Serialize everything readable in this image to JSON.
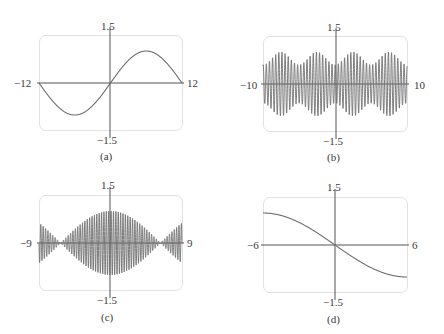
{
  "chart_data": [
    {
      "type": "line",
      "panel": "(a)",
      "title": "",
      "caption": "(a)",
      "xlim": [
        -12,
        12
      ],
      "ylim": [
        -1.5,
        1.5
      ],
      "tick_labels": {
        "xmin": "−12",
        "xmax": "12",
        "ymax": "1.5",
        "ymin": "−1.5"
      },
      "grid": false,
      "description": "Single period of a slow sine wave; min ~-1 near x=-6, max ~+1 near x=6, passes through origin, reaches 0 at x=±12",
      "x": [
        -12,
        -9,
        -6,
        -3,
        0,
        3,
        6,
        9,
        12
      ],
      "y": [
        0,
        -0.71,
        -1.0,
        -0.71,
        0,
        0.71,
        1.0,
        0.71,
        0
      ]
    },
    {
      "type": "line",
      "panel": "(b)",
      "title": "",
      "caption": "(b)",
      "xlim": [
        -10,
        10
      ],
      "ylim": [
        -1.5,
        1.5
      ],
      "tick_labels": {
        "xmin": "−10",
        "xmax": "10",
        "ymax": "1.5",
        "ymin": "−1.5"
      },
      "grid": false,
      "description": "Rapid oscillation (~46 cycles across window) with amplitude modulated between ~0.55 and ~1.0; envelope dips near x≈-5 and x≈5, peaks near x≈-7.5, 0±, 7.5",
      "envelope_x": [
        -10,
        -7.5,
        -5,
        -2.5,
        0,
        2.5,
        5,
        7.5,
        10
      ],
      "envelope_upper": [
        0.6,
        1.0,
        0.6,
        1.0,
        0.6,
        1.0,
        0.6,
        1.0,
        0.6
      ],
      "oscillation_cycles": 46
    },
    {
      "type": "line",
      "panel": "(c)",
      "title": "",
      "caption": "(c)",
      "xlim": [
        -9,
        9
      ],
      "ylim": [
        -1.5,
        1.5
      ],
      "tick_labels": {
        "xmin": "−9",
        "xmax": "9",
        "ymax": "1.5",
        "ymin": "−1.5"
      },
      "grid": false,
      "description": "Beat pattern: fast oscillation (~60 cycles) inside envelope |cos(x/3)|-like; amplitude ~1.0 at x=0, ~0 at x≈±6.2, ~0.6 at x=±9",
      "envelope_x": [
        -9,
        -6,
        -3,
        0,
        3,
        6,
        9
      ],
      "envelope_upper": [
        0.65,
        0.05,
        0.6,
        1.0,
        0.6,
        0.05,
        0.65
      ],
      "oscillation_cycles": 60
    },
    {
      "type": "line",
      "panel": "(d)",
      "title": "",
      "caption": "(d)",
      "xlim": [
        -6,
        6
      ],
      "ylim": [
        -1.5,
        1.5
      ],
      "tick_labels": {
        "xmin": "−6",
        "xmax": "6",
        "ymax": "1.5",
        "ymin": "−1.5"
      },
      "grid": false,
      "description": "Smooth decreasing curve (like -sin(x/4)), from ~1.0 at x=-6 through origin to ~-1.0 at x=6",
      "x": [
        -6,
        -4,
        -2,
        0,
        2,
        4,
        6
      ],
      "y": [
        1.0,
        0.84,
        0.48,
        0,
        -0.48,
        -0.84,
        -1.0
      ]
    }
  ],
  "panels": [
    {
      "caption": "(a)",
      "xmin": "−12",
      "xmax": "12",
      "ymax": "1.5",
      "ymin": "−1.5"
    },
    {
      "caption": "(b)",
      "xmin": "−10",
      "xmax": "10",
      "ymax": "1.5",
      "ymin": "−1.5"
    },
    {
      "caption": "(c)",
      "xmin": "−9",
      "xmax": "9",
      "ymax": "1.5",
      "ymin": "−1.5"
    },
    {
      "caption": "(d)",
      "xmin": "−6",
      "xmax": "6",
      "ymax": "1.5",
      "ymin": "−1.5"
    }
  ],
  "colors": {
    "curve": "#6e6e6e",
    "axis": "#555555",
    "frame": "#e2e2e2",
    "text": "#3a3a3a"
  }
}
